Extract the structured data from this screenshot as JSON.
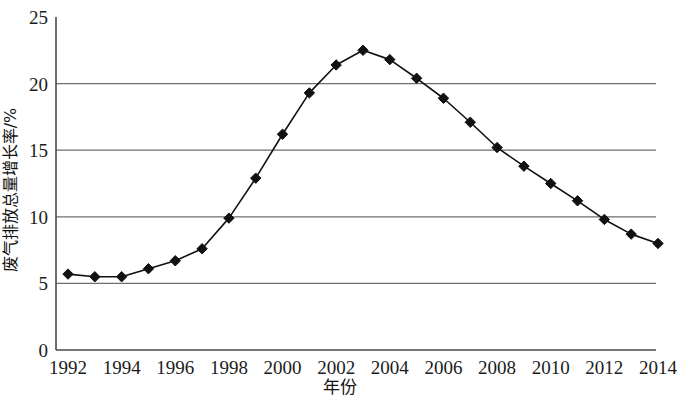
{
  "chart_data": {
    "type": "line",
    "title": "",
    "xlabel": "年份",
    "ylabel": "废气排放总量增长率/%",
    "x": [
      1992,
      1993,
      1994,
      1995,
      1996,
      1997,
      1998,
      1999,
      2000,
      2001,
      2002,
      2003,
      2004,
      2005,
      2006,
      2007,
      2008,
      2009,
      2010,
      2011,
      2012,
      2013,
      2014
    ],
    "values": [
      5.7,
      5.5,
      5.5,
      6.1,
      6.7,
      7.6,
      9.9,
      12.9,
      16.2,
      19.3,
      21.4,
      22.5,
      21.8,
      20.4,
      18.9,
      17.1,
      15.2,
      13.8,
      12.5,
      11.2,
      9.8,
      8.7,
      8.0
    ],
    "series": [
      {
        "name": "废气排放总量增长率",
        "values": [
          5.7,
          5.5,
          5.5,
          6.1,
          6.7,
          7.6,
          9.9,
          12.9,
          16.2,
          19.3,
          21.4,
          22.5,
          21.8,
          20.4,
          18.9,
          17.1,
          15.2,
          13.8,
          12.5,
          11.2,
          9.8,
          8.7,
          8.0
        ]
      }
    ],
    "xlim": [
      1992,
      2014
    ],
    "ylim": [
      0,
      25
    ],
    "ytick_labels": [
      "0",
      "5",
      "10",
      "15",
      "20",
      "25"
    ],
    "ytick_values": [
      0,
      5,
      10,
      15,
      20,
      25
    ],
    "xtick_labels": [
      "1992",
      "1994",
      "1996",
      "1998",
      "2000",
      "2002",
      "2004",
      "2006",
      "2008",
      "2010",
      "2012",
      "2014"
    ],
    "xtick_values": [
      1992,
      1994,
      1996,
      1998,
      2000,
      2002,
      2004,
      2006,
      2008,
      2010,
      2012,
      2014
    ],
    "grid": "horizontal",
    "legend": "none",
    "marker": "diamond",
    "line_color": "#111111",
    "marker_color": "#111111",
    "grid_color": "#6e6e6e",
    "axis_color": "#4a4a4a",
    "background_color": "#ffffff"
  }
}
